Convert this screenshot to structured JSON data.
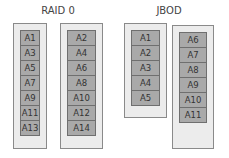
{
  "raid0": {
    "title": "RAID 0",
    "disks": [
      {
        "blocks": [
          "A1",
          "A3",
          "A5",
          "A7",
          "A9",
          "A11",
          "A13"
        ]
      },
      {
        "blocks": [
          "A2",
          "A4",
          "A6",
          "A8",
          "A10",
          "A12",
          "A14"
        ]
      }
    ]
  },
  "jbod": {
    "title": "JBOD",
    "disks": [
      {
        "blocks": [
          "A1",
          "A2",
          "A3",
          "A4",
          "A5"
        ]
      },
      {
        "blocks": [
          "A6",
          "A7",
          "A8",
          "A9",
          "A10",
          "A11"
        ]
      }
    ]
  },
  "colors": {
    "disk_fill": "#ececec",
    "block_fill": "#a9a9a9",
    "border": "#6f6f6f"
  }
}
